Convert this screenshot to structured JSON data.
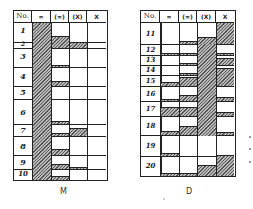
{
  "header": {
    "columns": [
      "No.",
      "=",
      "(=)",
      "(X)",
      "X"
    ]
  },
  "tables": [
    {
      "caption": "M",
      "rows": [
        "1",
        "2",
        "3",
        "4",
        "5",
        "6",
        "7",
        "8",
        "9",
        "10"
      ]
    },
    {
      "caption": "D",
      "rows": [
        "11",
        "12",
        "13",
        "14",
        "15",
        "16",
        "17",
        "18",
        "19",
        "20"
      ]
    }
  ],
  "colors": {
    "line": "#222222",
    "hatch_dark": "#555555",
    "hatch_light": "#bbbbbb"
  }
}
